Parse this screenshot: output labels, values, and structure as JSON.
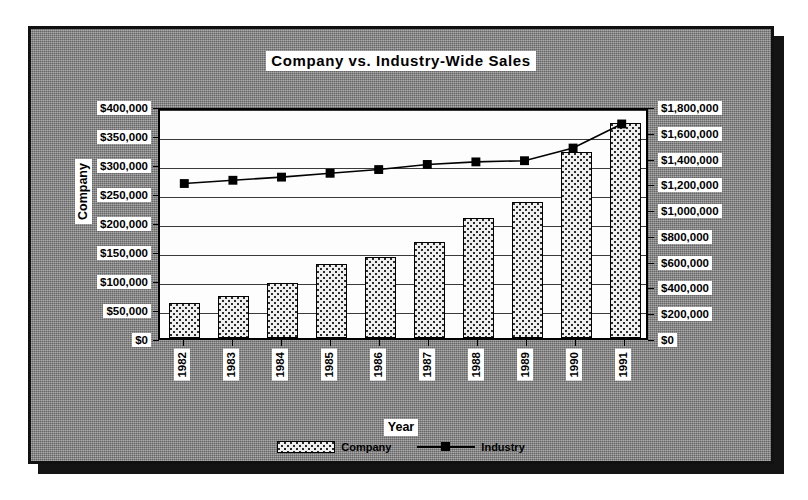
{
  "chart_data": {
    "type": "bar",
    "title": "Company vs. Industry-Wide Sales",
    "xlabel": "Year",
    "ylabel": "Company",
    "y2label": "",
    "categories": [
      "1982",
      "1983",
      "1984",
      "1985",
      "1986",
      "1987",
      "1988",
      "1989",
      "1990",
      "1991"
    ],
    "grid": true,
    "legend_position": "bottom",
    "ylim": [
      0,
      400000
    ],
    "y2lim": [
      0,
      1800000
    ],
    "yticks": [
      "$0",
      "$50,000",
      "$100,000",
      "$150,000",
      "$200,000",
      "$250,000",
      "$300,000",
      "$350,000",
      "$400,000"
    ],
    "ytick_values": [
      0,
      50000,
      100000,
      150000,
      200000,
      250000,
      300000,
      350000,
      400000
    ],
    "y2ticks": [
      "$0",
      "$200,000",
      "$400,000",
      "$600,000",
      "$800,000",
      "$1,000,000",
      "$1,200,000",
      "$1,400,000",
      "$1,600,000",
      "$1,800,000"
    ],
    "y2tick_values": [
      0,
      200000,
      400000,
      600000,
      800000,
      1000000,
      1200000,
      1400000,
      1600000,
      1800000
    ],
    "series": [
      {
        "name": "Company",
        "kind": "bar",
        "axis": "left",
        "values": [
          60000,
          72000,
          95000,
          128000,
          140000,
          165000,
          207000,
          235000,
          320000,
          370000
        ]
      },
      {
        "name": "Industry",
        "kind": "line",
        "axis": "right",
        "values": [
          1220000,
          1245000,
          1270000,
          1300000,
          1330000,
          1370000,
          1390000,
          1400000,
          1500000,
          1690000
        ]
      }
    ]
  },
  "legend": {
    "items": [
      {
        "label": "Company",
        "marker": "pattern-swatch"
      },
      {
        "label": "Industry",
        "marker": "line-with-square-marker"
      }
    ]
  },
  "colors": {
    "frame_background": "#8a8a8a",
    "frame_border": "#111111",
    "plot_background": "#fdfdfd",
    "bar_fill": "#efefef",
    "bar_outline": "#000000",
    "line": "#000000",
    "marker": "#000000",
    "gridline": "#3a3a3a",
    "label_background": "#ffffff",
    "text": "#000000"
  }
}
